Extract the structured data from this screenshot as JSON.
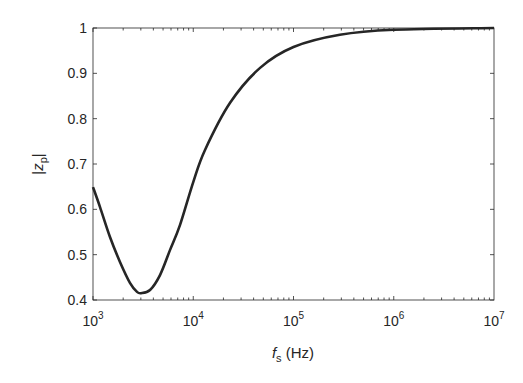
{
  "chart_data": {
    "type": "line",
    "title": "",
    "xlabel": "f_s (Hz)",
    "xlabel_parts": {
      "italic": "f",
      "sub": "s",
      "rest": " (Hz)"
    },
    "ylabel": "|z_p|",
    "ylabel_parts": {
      "pre": "|",
      "italic": "z",
      "sub": "p",
      "post": "|"
    },
    "xscale": "log",
    "xlim": [
      1000,
      10000000
    ],
    "ylim": [
      0.4,
      1.0
    ],
    "grid": false,
    "legend": null,
    "x_ticks": [
      {
        "value": 1000,
        "base": "10",
        "exp": "3"
      },
      {
        "value": 10000,
        "base": "10",
        "exp": "4"
      },
      {
        "value": 100000,
        "base": "10",
        "exp": "5"
      },
      {
        "value": 1000000,
        "base": "10",
        "exp": "6"
      },
      {
        "value": 10000000,
        "base": "10",
        "exp": "7"
      }
    ],
    "y_ticks": [
      {
        "value": 0.4,
        "label": "0.4"
      },
      {
        "value": 0.5,
        "label": "0.5"
      },
      {
        "value": 0.6,
        "label": "0.6"
      },
      {
        "value": 0.7,
        "label": "0.7"
      },
      {
        "value": 0.8,
        "label": "0.8"
      },
      {
        "value": 0.9,
        "label": "0.9"
      },
      {
        "value": 1.0,
        "label": "1"
      }
    ],
    "series": [
      {
        "name": "|z_p|",
        "color": "#262626",
        "x": [
          1000,
          1175,
          1477,
          1858,
          2336,
          2748,
          3010,
          3705,
          4660,
          5860,
          7370,
          10000,
          13100,
          23300,
          46400,
          100000,
          290000,
          1000000,
          10000000
        ],
        "values": [
          0.649,
          0.605,
          0.539,
          0.484,
          0.438,
          0.418,
          0.415,
          0.422,
          0.455,
          0.51,
          0.565,
          0.66,
          0.731,
          0.835,
          0.912,
          0.958,
          0.985,
          0.996,
          1.0
        ]
      }
    ]
  }
}
